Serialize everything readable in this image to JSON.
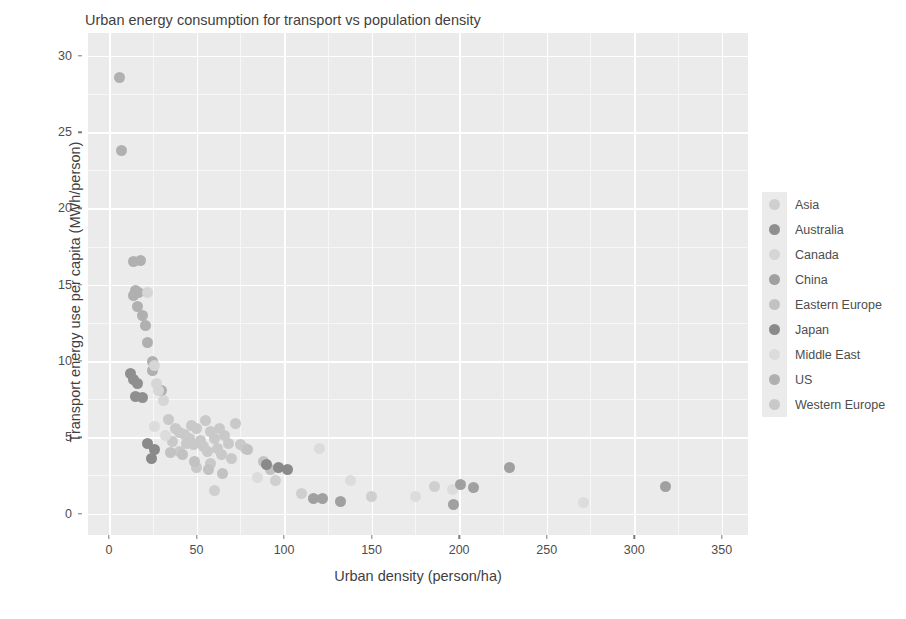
{
  "chart": {
    "title": "Urban energy consumption for transport vs population density",
    "xlabel": "Urban density (person/ha)",
    "ylabel": "Transport energy use per capita (MWh/person)"
  },
  "legend": {
    "position": "right",
    "entries": [
      {
        "label": "Asia",
        "color": "#cfcfcf"
      },
      {
        "label": "Australia",
        "color": "#8f8f8f"
      },
      {
        "label": "Canada",
        "color": "#d6d6d6"
      },
      {
        "label": "China",
        "color": "#a0a0a0"
      },
      {
        "label": "Eastern Europe",
        "color": "#c2c2c2"
      },
      {
        "label": "Japan",
        "color": "#8a8a8a"
      },
      {
        "label": "Middle East",
        "color": "#dcdcdc"
      },
      {
        "label": "US",
        "color": "#b0b0b0"
      },
      {
        "label": "Western Europe",
        "color": "#c9c9c9"
      }
    ]
  },
  "chart_data": {
    "type": "scatter",
    "title": "Urban energy consumption for transport vs population density",
    "xlabel": "Urban density (person/ha)",
    "ylabel": "Transport energy use per capita (MWh/person)",
    "xlim": [
      -12,
      365
    ],
    "ylim": [
      -1.4,
      31.5
    ],
    "xticks": [
      0,
      50,
      100,
      150,
      200,
      250,
      300,
      350
    ],
    "yticks": [
      0,
      5,
      10,
      15,
      20,
      25,
      30
    ],
    "grid": true,
    "point_size": 11,
    "series": [
      {
        "name": "US",
        "color": "#b0b0b0",
        "points": [
          {
            "x": 6,
            "y": 28.6
          },
          {
            "x": 7,
            "y": 23.8
          },
          {
            "x": 14,
            "y": 16.5
          },
          {
            "x": 18,
            "y": 16.6
          },
          {
            "x": 15,
            "y": 14.6
          },
          {
            "x": 14,
            "y": 14.3
          },
          {
            "x": 17,
            "y": 14.5
          },
          {
            "x": 16,
            "y": 13.6
          },
          {
            "x": 19,
            "y": 13.0
          },
          {
            "x": 21,
            "y": 12.3
          },
          {
            "x": 22,
            "y": 11.2
          },
          {
            "x": 25,
            "y": 10.0
          },
          {
            "x": 25,
            "y": 9.4
          },
          {
            "x": 30,
            "y": 8.1
          }
        ]
      },
      {
        "name": "Australia",
        "color": "#8f8f8f",
        "points": [
          {
            "x": 12,
            "y": 9.2
          },
          {
            "x": 14,
            "y": 8.8
          },
          {
            "x": 16,
            "y": 8.5
          },
          {
            "x": 15,
            "y": 7.7
          },
          {
            "x": 19,
            "y": 7.6
          }
        ]
      },
      {
        "name": "Canada",
        "color": "#d6d6d6",
        "points": [
          {
            "x": 22,
            "y": 14.5
          },
          {
            "x": 26,
            "y": 9.7
          },
          {
            "x": 28,
            "y": 8.1
          },
          {
            "x": 31,
            "y": 7.4
          },
          {
            "x": 27,
            "y": 8.5
          }
        ]
      },
      {
        "name": "Western Europe",
        "color": "#c9c9c9",
        "points": [
          {
            "x": 34,
            "y": 6.2
          },
          {
            "x": 38,
            "y": 5.6
          },
          {
            "x": 40,
            "y": 5.3
          },
          {
            "x": 43,
            "y": 5.2
          },
          {
            "x": 46,
            "y": 4.9
          },
          {
            "x": 44,
            "y": 4.6
          },
          {
            "x": 48,
            "y": 4.5
          },
          {
            "x": 50,
            "y": 5.6
          },
          {
            "x": 52,
            "y": 4.8
          },
          {
            "x": 54,
            "y": 4.4
          },
          {
            "x": 56,
            "y": 4.1
          },
          {
            "x": 58,
            "y": 5.4
          },
          {
            "x": 60,
            "y": 4.9
          },
          {
            "x": 62,
            "y": 4.3
          },
          {
            "x": 64,
            "y": 3.9
          },
          {
            "x": 66,
            "y": 5.1
          },
          {
            "x": 68,
            "y": 4.6
          },
          {
            "x": 72,
            "y": 5.9
          },
          {
            "x": 75,
            "y": 4.5
          },
          {
            "x": 78,
            "y": 4.3
          },
          {
            "x": 70,
            "y": 3.6
          },
          {
            "x": 58,
            "y": 3.3
          },
          {
            "x": 50,
            "y": 3.0
          },
          {
            "x": 40,
            "y": 4.1
          },
          {
            "x": 36,
            "y": 4.7
          },
          {
            "x": 47,
            "y": 5.8
          },
          {
            "x": 55,
            "y": 6.1
          },
          {
            "x": 63,
            "y": 5.6
          }
        ]
      },
      {
        "name": "Eastern Europe",
        "color": "#c2c2c2",
        "points": [
          {
            "x": 35,
            "y": 4.0
          },
          {
            "x": 42,
            "y": 3.9
          },
          {
            "x": 49,
            "y": 3.4
          },
          {
            "x": 57,
            "y": 2.9
          },
          {
            "x": 65,
            "y": 2.6
          },
          {
            "x": 88,
            "y": 3.4
          },
          {
            "x": 92,
            "y": 2.9
          },
          {
            "x": 79,
            "y": 4.2
          }
        ]
      },
      {
        "name": "Middle East",
        "color": "#dcdcdc",
        "points": [
          {
            "x": 26,
            "y": 5.7
          },
          {
            "x": 32,
            "y": 5.1
          },
          {
            "x": 85,
            "y": 2.4
          },
          {
            "x": 120,
            "y": 4.3
          },
          {
            "x": 175,
            "y": 1.1
          },
          {
            "x": 271,
            "y": 0.7
          },
          {
            "x": 196,
            "y": 1.6
          },
          {
            "x": 138,
            "y": 2.2
          }
        ]
      },
      {
        "name": "Japan",
        "color": "#8a8a8a",
        "points": [
          {
            "x": 22,
            "y": 4.6
          },
          {
            "x": 26,
            "y": 4.2
          },
          {
            "x": 24,
            "y": 3.6
          },
          {
            "x": 97,
            "y": 3.0
          },
          {
            "x": 102,
            "y": 2.9
          },
          {
            "x": 90,
            "y": 3.2
          }
        ]
      },
      {
        "name": "China",
        "color": "#a0a0a0",
        "points": [
          {
            "x": 117,
            "y": 1.0
          },
          {
            "x": 122,
            "y": 1.0
          },
          {
            "x": 132,
            "y": 0.8
          },
          {
            "x": 197,
            "y": 0.6
          },
          {
            "x": 201,
            "y": 1.9
          },
          {
            "x": 208,
            "y": 1.7
          },
          {
            "x": 229,
            "y": 3.0
          },
          {
            "x": 318,
            "y": 1.8
          }
        ]
      },
      {
        "name": "Asia",
        "color": "#cfcfcf",
        "points": [
          {
            "x": 60,
            "y": 1.5
          },
          {
            "x": 95,
            "y": 2.2
          },
          {
            "x": 110,
            "y": 1.3
          },
          {
            "x": 150,
            "y": 1.1
          },
          {
            "x": 186,
            "y": 1.8
          }
        ]
      }
    ]
  }
}
